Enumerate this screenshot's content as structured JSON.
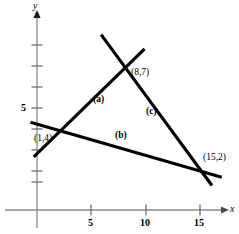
{
  "figure": {
    "background": "#ffffff",
    "line_color": "#000000",
    "axis_color": "#808080"
  },
  "axes": {
    "x_label": "x",
    "y_label": "y",
    "x_ticks": [
      {
        "label": "5",
        "value": 5
      },
      {
        "label": "10",
        "value": 10
      },
      {
        "label": "15",
        "value": 15
      }
    ],
    "y_ticks": [
      {
        "label": "5",
        "value": 5
      }
    ]
  },
  "chart_data": {
    "type": "line",
    "title": "",
    "xlabel": "x",
    "ylabel": "y",
    "xlim": [
      -1.5,
      18.5
    ],
    "ylim": [
      -3.5,
      12.5
    ],
    "grid": false,
    "legend": "none",
    "x_ticks": [
      5,
      10,
      15
    ],
    "x_ticklabels": [
      "5",
      "10",
      "15"
    ],
    "y_ticks": [
      5
    ],
    "y_ticklabels": [
      "5"
    ],
    "points": [
      {
        "label": "(8,7)",
        "x": 8,
        "y": 7
      },
      {
        "label": "(1,4)",
        "x": 1,
        "y": 4
      },
      {
        "label": "(15,2)",
        "x": 15,
        "y": 2
      }
    ],
    "series": [
      {
        "name": "(a)",
        "from": [
          1,
          4
        ],
        "to": [
          8,
          7
        ],
        "draw_from": [
          -0.3,
          2.6
        ],
        "draw_to": [
          9.9,
          7.9
        ]
      },
      {
        "name": "(b)",
        "from": [
          1,
          4
        ],
        "to": [
          15,
          2
        ],
        "draw_from": [
          -0.6,
          4.3
        ],
        "draw_to": [
          17.0,
          1.6
        ]
      },
      {
        "name": "(c)",
        "from": [
          8,
          7
        ],
        "to": [
          15,
          2
        ],
        "draw_from": [
          5.9,
          8.6
        ],
        "draw_to": [
          16.1,
          1.2
        ]
      }
    ],
    "segment_labels": [
      {
        "text": "(a)",
        "x": 5.2,
        "y": 5.6
      },
      {
        "text": "(b)",
        "x": 9.8,
        "y": 3.2
      },
      {
        "text": "(c)",
        "x": 12.0,
        "y": 4.9
      }
    ]
  }
}
